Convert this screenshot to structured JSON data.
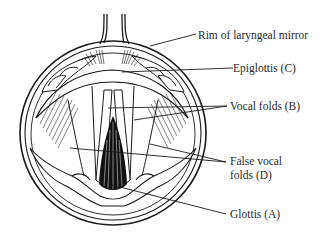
{
  "figure": {
    "colors": {
      "ink": "#1a1a1a",
      "background": "#ffffff",
      "glottis_fill": "#111111"
    }
  },
  "labels": [
    {
      "id": "rim",
      "text": "Rim of laryngeal mirror"
    },
    {
      "id": "epiglottis",
      "text": "Epiglottis (C)"
    },
    {
      "id": "vocal_folds",
      "text": "Vocal folds (B)"
    },
    {
      "id": "false_vocal_folds_line1",
      "text": "False vocal"
    },
    {
      "id": "false_vocal_folds_line2",
      "text": "folds (D)"
    },
    {
      "id": "glottis",
      "text": "Glottis (A)"
    }
  ]
}
